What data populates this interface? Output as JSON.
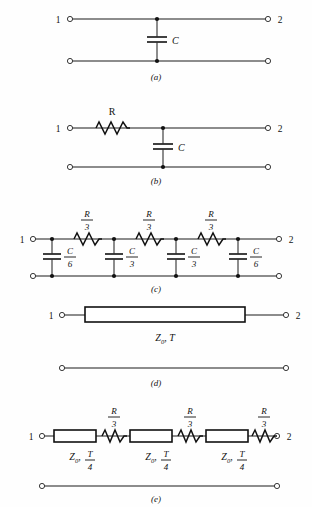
{
  "figure": {
    "background_color": "#fefefe",
    "ink_color": "#111111"
  },
  "terminals": {
    "left_label": "1",
    "right_label": "2"
  },
  "panels": [
    {
      "id": "a",
      "caption": "(a)",
      "description": "Single shunt capacitor two-port",
      "series_elements": [],
      "shunt_elements": [
        {
          "type": "capacitor",
          "label": "C",
          "label_kind": "plain"
        }
      ]
    },
    {
      "id": "b",
      "caption": "(b)",
      "description": "Series resistor with single shunt capacitor",
      "series_elements": [
        {
          "type": "resistor",
          "label": "R",
          "label_kind": "plain"
        }
      ],
      "shunt_elements": [
        {
          "type": "capacitor",
          "label": "C",
          "label_kind": "plain"
        }
      ]
    },
    {
      "id": "c",
      "caption": "(c)",
      "description": "Three-section lumped RC ladder network",
      "series_elements": [
        {
          "type": "resistor",
          "numerator": "R",
          "denominator": "3"
        },
        {
          "type": "resistor",
          "numerator": "R",
          "denominator": "3"
        },
        {
          "type": "resistor",
          "numerator": "R",
          "denominator": "3"
        }
      ],
      "shunt_elements": [
        {
          "type": "capacitor",
          "numerator": "C",
          "denominator": "6"
        },
        {
          "type": "capacitor",
          "numerator": "C",
          "denominator": "3"
        },
        {
          "type": "capacitor",
          "numerator": "C",
          "denominator": "3"
        },
        {
          "type": "capacitor",
          "numerator": "C",
          "denominator": "6"
        }
      ]
    },
    {
      "id": "d",
      "caption": "(d)",
      "description": "Single lossless transmission line",
      "line_elements": [
        {
          "type": "transmission-line",
          "impedance": "Z",
          "impedance_sub": "0",
          "separator": ", ",
          "delay": "T"
        }
      ]
    },
    {
      "id": "e",
      "caption": "(e)",
      "description": "Three cascaded transmission line segments with series resistors",
      "line_elements": [
        {
          "type": "transmission-line",
          "impedance": "Z",
          "impedance_sub": "0",
          "separator": ", ",
          "delay_num": "T",
          "delay_den": "4"
        },
        {
          "type": "transmission-line",
          "impedance": "Z",
          "impedance_sub": "0",
          "separator": ", ",
          "delay_num": "T",
          "delay_den": "4"
        },
        {
          "type": "transmission-line",
          "impedance": "Z",
          "impedance_sub": "0",
          "separator": ", ",
          "delay_num": "T",
          "delay_den": "4"
        }
      ],
      "series_elements": [
        {
          "type": "resistor",
          "numerator": "R",
          "denominator": "3"
        },
        {
          "type": "resistor",
          "numerator": "R",
          "denominator": "3"
        },
        {
          "type": "resistor",
          "numerator": "R",
          "denominator": "3"
        }
      ]
    }
  ]
}
